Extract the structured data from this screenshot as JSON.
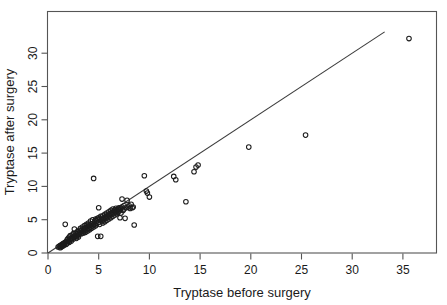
{
  "chart_data": {
    "type": "scatter",
    "title": "",
    "xlabel": "Tryptase before surgery",
    "ylabel": "Tryptase after surgery",
    "xlim": [
      0,
      37.5
    ],
    "ylim": [
      0,
      33.5
    ],
    "xticks": [
      0,
      5,
      10,
      15,
      20,
      25,
      30,
      35
    ],
    "yticks": [
      0,
      5,
      10,
      15,
      20,
      25,
      30
    ],
    "xtick_labels": [
      "0",
      "5",
      "10",
      "15",
      "20",
      "25",
      "30",
      "35"
    ],
    "ytick_labels": [
      "0",
      "5",
      "10",
      "15",
      "20",
      "25",
      "30"
    ],
    "grid": false,
    "legend": null,
    "marker": "open-circle",
    "annotations": [
      {
        "name": "identity-line",
        "type": "line",
        "description": "y = x reference line",
        "from": [
          0,
          0
        ],
        "to": [
          33.2,
          33.2
        ]
      }
    ],
    "series": [
      {
        "name": "Patients",
        "marker": "open-circle",
        "color": "#1c1c1c",
        "points": [
          [
            1.0,
            0.9
          ],
          [
            1.1,
            1.0
          ],
          [
            1.2,
            1.1
          ],
          [
            1.2,
            0.8
          ],
          [
            1.3,
            1.2
          ],
          [
            1.3,
            0.9
          ],
          [
            1.4,
            1.3
          ],
          [
            1.4,
            1.0
          ],
          [
            1.5,
            1.4
          ],
          [
            1.5,
            1.1
          ],
          [
            1.6,
            1.5
          ],
          [
            1.6,
            1.2
          ],
          [
            1.7,
            4.3
          ],
          [
            1.7,
            1.6
          ],
          [
            1.8,
            1.3
          ],
          [
            1.8,
            1.7
          ],
          [
            1.9,
            1.5
          ],
          [
            1.9,
            2.0
          ],
          [
            2.0,
            1.8
          ],
          [
            2.0,
            2.2
          ],
          [
            2.1,
            1.6
          ],
          [
            2.1,
            2.4
          ],
          [
            2.2,
            2.0
          ],
          [
            2.2,
            2.6
          ],
          [
            2.3,
            2.2
          ],
          [
            2.3,
            1.8
          ],
          [
            2.4,
            2.7
          ],
          [
            2.4,
            2.3
          ],
          [
            2.5,
            2.1
          ],
          [
            2.5,
            2.9
          ],
          [
            2.6,
            2.5
          ],
          [
            2.6,
            3.6
          ],
          [
            2.7,
            2.4
          ],
          [
            2.7,
            3.0
          ],
          [
            2.8,
            2.8
          ],
          [
            2.8,
            2.2
          ],
          [
            2.9,
            3.2
          ],
          [
            2.9,
            2.6
          ],
          [
            3.0,
            3.0
          ],
          [
            3.0,
            2.4
          ],
          [
            3.1,
            3.4
          ],
          [
            3.1,
            2.8
          ],
          [
            3.2,
            3.1
          ],
          [
            3.2,
            3.7
          ],
          [
            3.3,
            2.9
          ],
          [
            3.3,
            3.4
          ],
          [
            3.4,
            3.2
          ],
          [
            3.4,
            3.9
          ],
          [
            3.5,
            3.0
          ],
          [
            3.5,
            3.6
          ],
          [
            3.6,
            3.3
          ],
          [
            3.6,
            4.1
          ],
          [
            3.7,
            3.1
          ],
          [
            3.7,
            3.8
          ],
          [
            3.8,
            3.5
          ],
          [
            3.8,
            4.3
          ],
          [
            3.9,
            3.3
          ],
          [
            3.9,
            4.0
          ],
          [
            4.0,
            3.7
          ],
          [
            4.0,
            4.5
          ],
          [
            4.1,
            3.5
          ],
          [
            4.1,
            4.2
          ],
          [
            4.2,
            3.9
          ],
          [
            4.2,
            4.8
          ],
          [
            4.3,
            3.7
          ],
          [
            4.3,
            4.4
          ],
          [
            4.4,
            4.1
          ],
          [
            4.4,
            5.0
          ],
          [
            4.5,
            11.2
          ],
          [
            4.5,
            3.9
          ],
          [
            4.6,
            4.6
          ],
          [
            4.6,
            4.3
          ],
          [
            4.7,
            5.1
          ],
          [
            4.7,
            4.1
          ],
          [
            4.8,
            4.8
          ],
          [
            4.8,
            4.4
          ],
          [
            4.9,
            5.2
          ],
          [
            4.9,
            2.5
          ],
          [
            5.0,
            6.8
          ],
          [
            5.0,
            4.6
          ],
          [
            5.0,
            5.3
          ],
          [
            5.1,
            4.3
          ],
          [
            5.1,
            5.0
          ],
          [
            5.2,
            2.5
          ],
          [
            5.2,
            5.5
          ],
          [
            5.3,
            4.8
          ],
          [
            5.3,
            5.2
          ],
          [
            5.4,
            4.5
          ],
          [
            5.4,
            5.6
          ],
          [
            5.5,
            5.0
          ],
          [
            5.5,
            5.3
          ],
          [
            5.6,
            4.7
          ],
          [
            5.6,
            5.8
          ],
          [
            5.7,
            5.2
          ],
          [
            5.7,
            5.5
          ],
          [
            5.8,
            4.9
          ],
          [
            5.8,
            6.0
          ],
          [
            5.9,
            5.4
          ],
          [
            5.9,
            5.7
          ],
          [
            6.0,
            5.1
          ],
          [
            6.0,
            6.2
          ],
          [
            6.1,
            5.6
          ],
          [
            6.1,
            5.9
          ],
          [
            6.2,
            5.3
          ],
          [
            6.2,
            6.4
          ],
          [
            6.3,
            5.8
          ],
          [
            6.3,
            6.1
          ],
          [
            6.4,
            6.6
          ],
          [
            6.4,
            5.5
          ],
          [
            6.5,
            6.3
          ],
          [
            6.5,
            6.0
          ],
          [
            6.6,
            6.5
          ],
          [
            6.6,
            5.7
          ],
          [
            6.7,
            6.2
          ],
          [
            6.7,
            6.7
          ],
          [
            6.8,
            6.4
          ],
          [
            6.8,
            5.9
          ],
          [
            6.9,
            6.6
          ],
          [
            6.9,
            6.1
          ],
          [
            7.0,
            6.8
          ],
          [
            7.0,
            6.3
          ],
          [
            7.1,
            6.5
          ],
          [
            7.1,
            5.3
          ],
          [
            7.2,
            6.7
          ],
          [
            7.2,
            6.0
          ],
          [
            7.3,
            8.1
          ],
          [
            7.3,
            6.9
          ],
          [
            7.4,
            6.4
          ],
          [
            7.5,
            7.1
          ],
          [
            7.5,
            6.6
          ],
          [
            7.6,
            5.2
          ],
          [
            7.7,
            6.8
          ],
          [
            7.8,
            7.9
          ],
          [
            7.9,
            6.9
          ],
          [
            8.0,
            7.1
          ],
          [
            8.1,
            6.7
          ],
          [
            8.2,
            7.3
          ],
          [
            8.3,
            6.8
          ],
          [
            8.4,
            6.9
          ],
          [
            8.5,
            4.2
          ],
          [
            9.5,
            11.6
          ],
          [
            9.7,
            9.3
          ],
          [
            9.8,
            9.0
          ],
          [
            10.0,
            8.4
          ],
          [
            12.4,
            11.5
          ],
          [
            12.6,
            11.0
          ],
          [
            13.6,
            7.7
          ],
          [
            14.4,
            12.2
          ],
          [
            14.6,
            12.9
          ],
          [
            14.8,
            13.2
          ],
          [
            19.8,
            15.9
          ],
          [
            25.4,
            17.7
          ],
          [
            35.6,
            32.2
          ]
        ]
      }
    ]
  },
  "axes": {
    "x_title": "Tryptase before surgery",
    "y_title": "Tryptase after surgery"
  }
}
